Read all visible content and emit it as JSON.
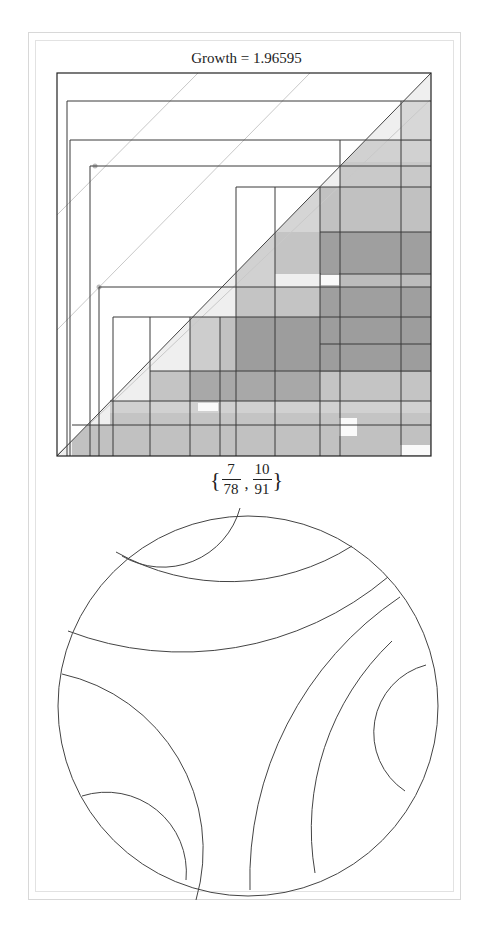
{
  "title": "Growth = 1.96595",
  "label": {
    "open": "{",
    "close": "}",
    "fractions": [
      {
        "num": "7",
        "den": "78"
      },
      {
        "num": "10",
        "den": "91"
      }
    ],
    "separator": ","
  },
  "plot": {
    "box": {
      "x": 57,
      "y": 73,
      "w": 374,
      "h": 383
    },
    "line_color": "#3a3a3a",
    "guide_color": "#c8c8c8",
    "guide_lines": [
      [
        57,
        330,
        310,
        73
      ],
      [
        57,
        215,
        198,
        73
      ],
      [
        57,
        455,
        430,
        100
      ]
    ],
    "guide_points": [
      [
        95,
        166
      ],
      [
        99,
        287
      ]
    ],
    "shaded_blocks": [
      [
        401,
        101,
        30,
        40,
        0.28
      ],
      [
        340,
        140,
        91,
        22,
        0.35
      ],
      [
        340,
        162,
        91,
        25,
        0.45
      ],
      [
        320,
        187,
        111,
        45,
        0.55
      ],
      [
        275,
        187,
        45,
        45,
        0.3
      ],
      [
        275,
        232,
        156,
        42,
        0.5
      ],
      [
        236,
        232,
        39,
        55,
        0.35
      ],
      [
        236,
        287,
        195,
        30,
        0.5
      ],
      [
        220,
        317,
        211,
        54,
        0.55
      ],
      [
        190,
        317,
        30,
        54,
        0.4
      ],
      [
        150,
        371,
        281,
        30,
        0.5
      ],
      [
        110,
        401,
        321,
        12,
        0.35
      ],
      [
        110,
        413,
        321,
        12,
        0.5
      ],
      [
        72,
        425,
        359,
        31,
        0.55
      ],
      [
        190,
        371,
        130,
        30,
        0.45
      ],
      [
        320,
        232,
        111,
        140,
        0.6
      ],
      [
        236,
        317,
        84,
        54,
        0.6
      ]
    ],
    "light_patches": [
      [
        321,
        273,
        18,
        12
      ],
      [
        198,
        403,
        20,
        8
      ],
      [
        339,
        418,
        18,
        18
      ],
      [
        400,
        445,
        30,
        10
      ]
    ],
    "hlines": [
      [
        67,
        431,
        101
      ],
      [
        70,
        431,
        140
      ],
      [
        90,
        431,
        166
      ],
      [
        236,
        431,
        187
      ],
      [
        99,
        431,
        287
      ],
      [
        113,
        431,
        317
      ],
      [
        150,
        431,
        371
      ],
      [
        110,
        431,
        401
      ],
      [
        72,
        431,
        425
      ],
      [
        320,
        431,
        232
      ],
      [
        320,
        431,
        274
      ],
      [
        320,
        431,
        344
      ]
    ],
    "vlines": [
      [
        67,
        101,
        456
      ],
      [
        70,
        140,
        456
      ],
      [
        90,
        166,
        456
      ],
      [
        99,
        287,
        456
      ],
      [
        113,
        317,
        456
      ],
      [
        150,
        317,
        456
      ],
      [
        190,
        317,
        456
      ],
      [
        220,
        317,
        456
      ],
      [
        236,
        187,
        456
      ],
      [
        275,
        187,
        456
      ],
      [
        320,
        187,
        456
      ],
      [
        340,
        140,
        456
      ],
      [
        401,
        101,
        456
      ]
    ]
  },
  "disk": {
    "cx": 248,
    "cy": 706,
    "r": 190,
    "arcs": [
      "M 240 508 A 80 80 0 0 1 122 556",
      "M 116 552 A 230 230 0 0 0 352 546",
      "M 388 577 A 320 320 0 0 1 68 631",
      "M 62 674 A 180 180 0 0 1 196 900",
      "M 82 796 A 80 80 0 0 1 186 880",
      "M 400 597 A 340 340 0 0 0 250 890",
      "M 392 641 A 260 260 0 0 0 315 873",
      "M 426 665 A 70 70 0 0 0 405 791"
    ]
  }
}
